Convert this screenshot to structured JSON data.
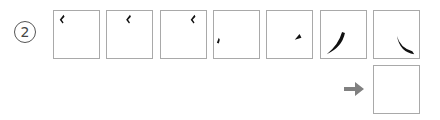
{
  "question": {
    "number_label": "2",
    "stroke_colors": {
      "stroke": "#111111",
      "box_border": "#a9a9a9",
      "arrow": "#808080"
    },
    "sequence": [
      {
        "index": 1,
        "stroke": "hook-left-stroke-topleft"
      },
      {
        "index": 2,
        "stroke": "hook-left-stroke-topcenter"
      },
      {
        "index": 3,
        "stroke": "hook-left-stroke-topright"
      },
      {
        "index": 4,
        "stroke": "dot-stroke-left"
      },
      {
        "index": 5,
        "stroke": "dot-stroke-right"
      },
      {
        "index": 6,
        "stroke": "left-falling-stroke"
      },
      {
        "index": 7,
        "stroke": "right-falling-stroke"
      }
    ],
    "answer_box": {
      "value": ""
    },
    "arrow_icon": "right-arrow-icon"
  }
}
